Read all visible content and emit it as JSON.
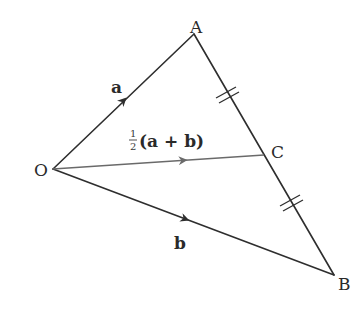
{
  "diagram": {
    "type": "vector geometry triangle",
    "colors": {
      "line": "#2e2e2e",
      "midline": "#6a6a6a",
      "text": "#2a2a2a",
      "background": "#ffffff"
    },
    "points": {
      "O": {
        "label": "O",
        "x": 53,
        "y": 169
      },
      "A": {
        "label": "A",
        "x": 194,
        "y": 34
      },
      "B": {
        "label": "B",
        "x": 334,
        "y": 275
      },
      "C": {
        "label": "C",
        "x": 264,
        "y": 155
      }
    },
    "vectors": {
      "a": {
        "label": "a",
        "from": "O",
        "to": "A"
      },
      "b": {
        "label": "b",
        "from": "O",
        "to": "B"
      },
      "oc": {
        "from": "O",
        "to": "C",
        "fraction_num": "1",
        "fraction_den": "2",
        "expression": "(a + b)"
      }
    },
    "equal_marks": [
      "AC",
      "CB"
    ],
    "edges": [
      "OA",
      "OB",
      "AB",
      "OC"
    ]
  }
}
